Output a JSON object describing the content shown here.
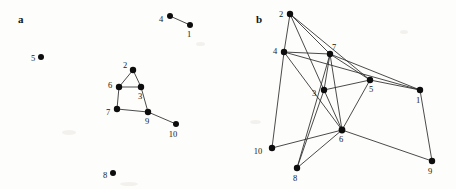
{
  "figure": {
    "width": 456,
    "height": 189,
    "background_color": "#fdfdfc",
    "node_color": "#0d0d0d",
    "edge_color": "#2a2a2a",
    "label_color": "#171717"
  },
  "panels": [
    {
      "id": "a",
      "label": "a",
      "label_pos": {
        "x": 18,
        "y": 14
      },
      "nodes": [
        {
          "id": "4",
          "label": "4",
          "x": 170,
          "y": 16,
          "r": 3.0,
          "label_dx": -9,
          "label_dy": 4
        },
        {
          "id": "1",
          "label": "1",
          "x": 190,
          "y": 25,
          "r": 3.0,
          "label_dx": -1,
          "label_dy": 10
        },
        {
          "id": "5",
          "label": "5",
          "x": 41,
          "y": 57,
          "r": 3.0,
          "label_dx": -8,
          "label_dy": 2
        },
        {
          "id": "2",
          "label": "2",
          "x": 133,
          "y": 70,
          "r": 3.2,
          "label_dx": -8,
          "label_dy": -4
        },
        {
          "id": "6",
          "label": "6",
          "x": 119,
          "y": 87,
          "r": 3.2,
          "label_dx": -9,
          "label_dy": -1
        },
        {
          "id": "3",
          "label": "3",
          "x": 141,
          "y": 87,
          "r": 3.2,
          "label_dx": -1,
          "label_dy": 10
        },
        {
          "id": "7",
          "label": "7",
          "x": 117,
          "y": 109,
          "r": 3.2,
          "label_dx": -9,
          "label_dy": 4
        },
        {
          "id": "9",
          "label": "9",
          "x": 148,
          "y": 112,
          "r": 3.2,
          "label_dx": -1,
          "label_dy": 10
        },
        {
          "id": "10",
          "label": "10",
          "x": 176,
          "y": 124,
          "r": 3.0,
          "label_dx": -3,
          "label_dy": 11
        },
        {
          "id": "8",
          "label": "8",
          "x": 113,
          "y": 173,
          "r": 3.0,
          "label_dx": -8,
          "label_dy": 3
        }
      ],
      "edges": [
        [
          "4",
          "1"
        ],
        [
          "2",
          "6"
        ],
        [
          "2",
          "3"
        ],
        [
          "6",
          "3"
        ],
        [
          "6",
          "7"
        ],
        [
          "3",
          "9"
        ],
        [
          "7",
          "9"
        ],
        [
          "9",
          "10"
        ]
      ],
      "isolated_nodes": [
        "5",
        "8"
      ]
    },
    {
      "id": "b",
      "label": "b",
      "label_pos": {
        "x": 28,
        "y": 14
      },
      "nodes": [
        {
          "id": "2",
          "label": "2",
          "x": 62,
          "y": 14,
          "r": 3.2,
          "label_dx": -9,
          "label_dy": 1
        },
        {
          "id": "4",
          "label": "4",
          "x": 56,
          "y": 52,
          "r": 3.2,
          "label_dx": -9,
          "label_dy": 0
        },
        {
          "id": "7",
          "label": "7",
          "x": 102,
          "y": 54,
          "r": 3.2,
          "label_dx": 4,
          "label_dy": -6
        },
        {
          "id": "3",
          "label": "3",
          "x": 96,
          "y": 90,
          "r": 3.2,
          "label_dx": -10,
          "label_dy": 4
        },
        {
          "id": "5",
          "label": "5",
          "x": 142,
          "y": 80,
          "r": 3.2,
          "label_dx": 1,
          "label_dy": 10
        },
        {
          "id": "1",
          "label": "1",
          "x": 192,
          "y": 90,
          "r": 3.2,
          "label_dx": -2,
          "label_dy": 11
        },
        {
          "id": "6",
          "label": "6",
          "x": 114,
          "y": 130,
          "r": 3.4,
          "label_dx": -1,
          "label_dy": 10
        },
        {
          "id": "10",
          "label": "10",
          "x": 44,
          "y": 148,
          "r": 3.2,
          "label_dx": -14,
          "label_dy": 4
        },
        {
          "id": "8",
          "label": "8",
          "x": 69,
          "y": 168,
          "r": 3.2,
          "label_dx": -2,
          "label_dy": 11
        },
        {
          "id": "9",
          "label": "9",
          "x": 204,
          "y": 161,
          "r": 3.2,
          "label_dx": -2,
          "label_dy": 11
        }
      ],
      "edges": [
        [
          "2",
          "4"
        ],
        [
          "2",
          "7"
        ],
        [
          "2",
          "3"
        ],
        [
          "2",
          "5"
        ],
        [
          "4",
          "7"
        ],
        [
          "4",
          "1"
        ],
        [
          "4",
          "10"
        ],
        [
          "4",
          "6"
        ],
        [
          "7",
          "3"
        ],
        [
          "7",
          "6"
        ],
        [
          "7",
          "8"
        ],
        [
          "7",
          "1"
        ],
        [
          "7",
          "5"
        ],
        [
          "3",
          "5"
        ],
        [
          "3",
          "6"
        ],
        [
          "3",
          "8"
        ],
        [
          "5",
          "1"
        ],
        [
          "5",
          "6"
        ],
        [
          "6",
          "10"
        ],
        [
          "6",
          "8"
        ],
        [
          "6",
          "9"
        ],
        [
          "1",
          "9"
        ]
      ],
      "isolated_nodes": []
    }
  ]
}
